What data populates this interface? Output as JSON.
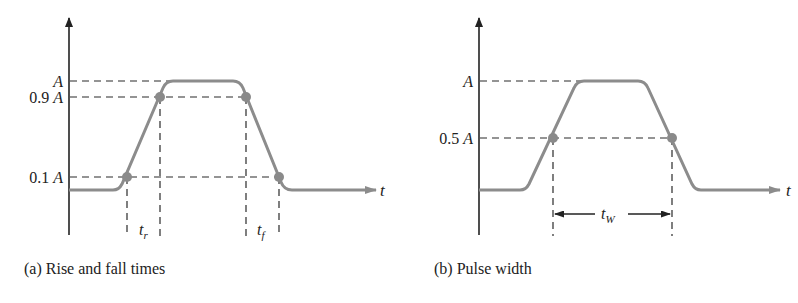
{
  "colors": {
    "axis": "#222222",
    "dash": "#2a2a2a",
    "waveform": "#8c8c8c",
    "marker": "#8a8a8a"
  },
  "panel_a": {
    "caption": "(a) Rise and fall times",
    "y_labels": {
      "top": "A",
      "high": "0.9A",
      "low": "0.1A"
    },
    "x_axis_label": "t",
    "rise_time_label": {
      "base": "t",
      "sub": "r"
    },
    "fall_time_label": {
      "base": "t",
      "sub": "f"
    }
  },
  "panel_b": {
    "caption": "(b) Pulse width",
    "y_labels": {
      "top": "A",
      "mid": "0.5A"
    },
    "x_axis_label": "t",
    "pulse_width_label": {
      "base": "t",
      "sub": "W"
    }
  }
}
